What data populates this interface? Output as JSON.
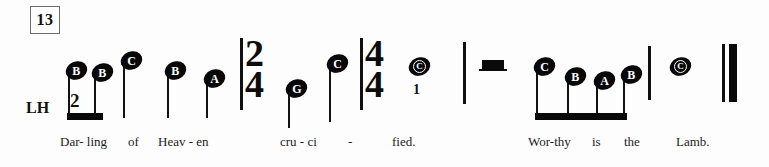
{
  "sheet": {
    "measure_number": "13",
    "hand_label": "LH",
    "background_color": "#fdfdfd",
    "ink_color": "#0a0a0a"
  },
  "time_signatures": [
    {
      "name": "two-four",
      "numerator": "2",
      "denominator": "4",
      "x": 245,
      "y": 38
    },
    {
      "name": "four-four",
      "numerator": "4",
      "denominator": "4",
      "x": 365,
      "y": 38
    }
  ],
  "notes": [
    {
      "id": "n1",
      "letter": "B",
      "x": 66,
      "y": 62,
      "stem": true,
      "stem_bottom": 118,
      "fingering": null
    },
    {
      "id": "n2",
      "letter": "B",
      "x": 92,
      "y": 64,
      "stem": true,
      "stem_bottom": 118,
      "fingering": null
    },
    {
      "id": "n3",
      "letter": "C",
      "x": 121,
      "y": 52,
      "stem": true,
      "stem_bottom": 118,
      "fingering": null
    },
    {
      "id": "n4",
      "letter": "B",
      "x": 165,
      "y": 62,
      "stem": true,
      "stem_bottom": 118,
      "fingering": null
    },
    {
      "id": "n5",
      "letter": "A",
      "x": 204,
      "y": 70,
      "stem": true,
      "stem_bottom": 118,
      "fingering": null
    },
    {
      "id": "n6",
      "letter": "G",
      "x": 286,
      "y": 80,
      "stem": true,
      "stem_bottom": 128,
      "fingering": null
    },
    {
      "id": "n7",
      "letter": "C",
      "x": 327,
      "y": 55,
      "stem": true,
      "stem_bottom": 122,
      "fingering": null
    },
    {
      "id": "n8",
      "letter": "C",
      "x": 409,
      "y": 58,
      "stem": false,
      "stem_bottom": 0,
      "fingering": "1"
    },
    {
      "id": "n9",
      "letter": "C",
      "x": 534,
      "y": 58,
      "stem": true,
      "stem_bottom": 118,
      "fingering": null
    },
    {
      "id": "n10",
      "letter": "B",
      "x": 565,
      "y": 68,
      "stem": true,
      "stem_bottom": 118,
      "fingering": null
    },
    {
      "id": "n11",
      "letter": "A",
      "x": 594,
      "y": 72,
      "stem": true,
      "stem_bottom": 118,
      "fingering": null
    },
    {
      "id": "n12",
      "letter": "B",
      "x": 621,
      "y": 66,
      "stem": true,
      "stem_bottom": 118,
      "fingering": null
    },
    {
      "id": "n13",
      "letter": "C",
      "x": 670,
      "y": 58,
      "stem": false,
      "stem_bottom": 0,
      "fingering": null
    }
  ],
  "beams": [
    {
      "name": "beam-group-1",
      "x": 67,
      "y": 113,
      "width": 36
    },
    {
      "name": "beam-group-2",
      "x": 535,
      "y": 113,
      "width": 92
    }
  ],
  "barlines": [
    {
      "name": "barline-1",
      "x": 240,
      "y": 38,
      "height": 72
    },
    {
      "name": "barline-2",
      "x": 360,
      "y": 38,
      "height": 72
    },
    {
      "name": "barline-3",
      "x": 463,
      "y": 42,
      "height": 62
    },
    {
      "name": "barline-4",
      "x": 648,
      "y": 46,
      "height": 54
    }
  ],
  "final_barline": {
    "name": "final-barline",
    "thin_x": 722,
    "thick_x": 729,
    "y": 44,
    "height": 58
  },
  "rest": {
    "name": "whole-rest",
    "x": 482,
    "y": 60,
    "width": 22,
    "height": 9
  },
  "fingering_start": {
    "value": "2",
    "x": 70,
    "y": 90
  },
  "lyrics": [
    {
      "text": "Dar- ling",
      "x": 60,
      "y": 134
    },
    {
      "text": "of",
      "x": 128,
      "y": 134
    },
    {
      "text": "Heav - en",
      "x": 158,
      "y": 134
    },
    {
      "text": "cru - ci",
      "x": 280,
      "y": 134
    },
    {
      "text": "-",
      "x": 348,
      "y": 134
    },
    {
      "text": "fied.",
      "x": 392,
      "y": 134
    },
    {
      "text": "Wor-thy",
      "x": 528,
      "y": 134
    },
    {
      "text": "is",
      "x": 592,
      "y": 134
    },
    {
      "text": "the",
      "x": 624,
      "y": 134
    },
    {
      "text": "Lamb.",
      "x": 676,
      "y": 134
    }
  ]
}
